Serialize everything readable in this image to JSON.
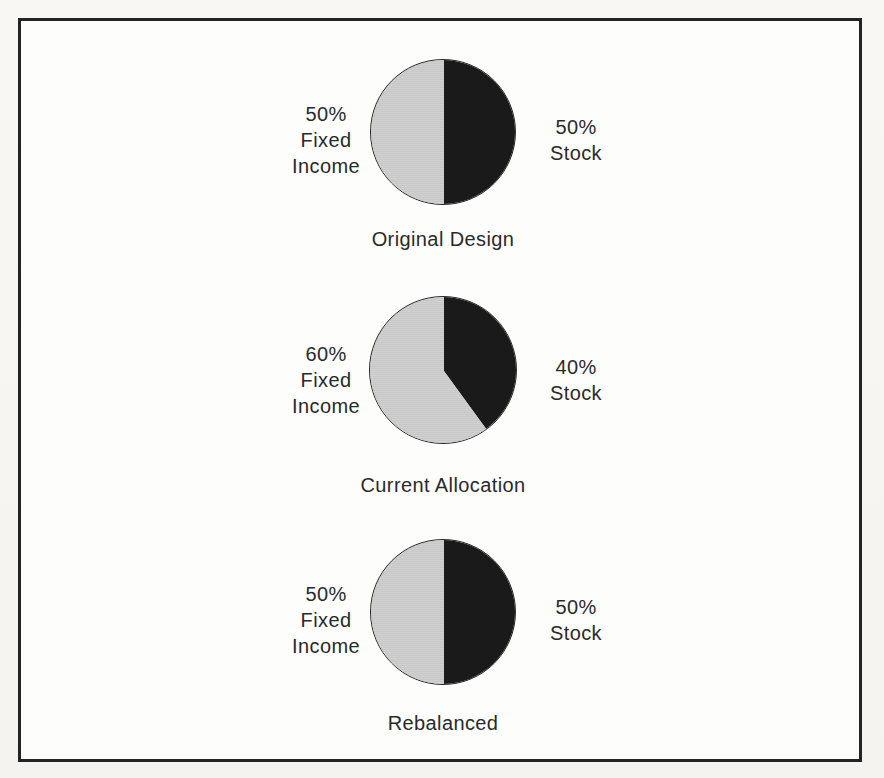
{
  "document": {
    "kind": "figure",
    "frame_color": "#232323",
    "page_background": "#f7f6f3"
  },
  "palette": {
    "stock_slice": "#1a1a1a",
    "fixed_income_slice": "#cfcfcf",
    "outline": "#2b2b2b",
    "text": "#2a2a2a"
  },
  "charts": [
    {
      "caption": "Original Design",
      "left_label": "50%\nFixed\nIncome",
      "right_label": "50%\nStock",
      "left_pct": 50,
      "right_pct": 50
    },
    {
      "caption": "Current Allocation",
      "left_label": "60%\nFixed\nIncome",
      "right_label": "40%\nStock",
      "left_pct": 60,
      "right_pct": 40
    },
    {
      "caption": "Rebalanced",
      "left_label": "50%\nFixed\nIncome",
      "right_label": "50%\nStock",
      "left_pct": 50,
      "right_pct": 50
    }
  ],
  "chart_data": [
    {
      "type": "pie",
      "title": "Original Design",
      "categories": [
        "Stock",
        "Fixed Income"
      ],
      "values": [
        50,
        50
      ],
      "labels": [
        "50% Stock",
        "50% Fixed Income"
      ],
      "colors": [
        "#1a1a1a",
        "#cfcfcf"
      ],
      "start_angle_deg": 0,
      "direction": "clockwise",
      "legend": "outside-left-right",
      "grid": false
    },
    {
      "type": "pie",
      "title": "Current Allocation",
      "categories": [
        "Stock",
        "Fixed Income"
      ],
      "values": [
        40,
        60
      ],
      "labels": [
        "40% Stock",
        "60% Fixed Income"
      ],
      "colors": [
        "#1a1a1a",
        "#cfcfcf"
      ],
      "start_angle_deg": 0,
      "direction": "clockwise",
      "legend": "outside-left-right",
      "grid": false
    },
    {
      "type": "pie",
      "title": "Rebalanced",
      "categories": [
        "Stock",
        "Fixed Income"
      ],
      "values": [
        50,
        50
      ],
      "labels": [
        "50% Stock",
        "50% Fixed Income"
      ],
      "colors": [
        "#1a1a1a",
        "#cfcfcf"
      ],
      "start_angle_deg": 0,
      "direction": "clockwise",
      "legend": "outside-left-right",
      "grid": false
    }
  ]
}
